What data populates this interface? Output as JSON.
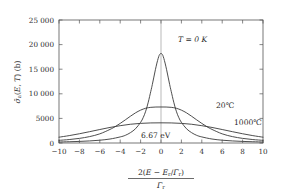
{
  "chart_data": {
    "type": "line",
    "title": "",
    "subtitle": "",
    "xlabel_numerator": "2(E − Eᵣ/Γᵣ)",
    "xlabel_denominator": "Γᵣ",
    "ylabel": "σ̄ₐ(E, T)  (b)",
    "xlim": [
      -10,
      10
    ],
    "ylim": [
      0,
      25000
    ],
    "xticks": [
      -10,
      -8,
      -6,
      -4,
      -2,
      0,
      2,
      4,
      6,
      8,
      10
    ],
    "xticklabels": [
      "−10",
      "−8",
      "−6",
      "−4",
      "−2",
      "0",
      "2",
      "4",
      "6",
      "8",
      "10"
    ],
    "yticks": [
      0,
      5000,
      10000,
      15000,
      20000,
      25000
    ],
    "yticklabels": [
      "0",
      "5000",
      "10 000",
      "15 000",
      "20 000",
      "25 000"
    ],
    "grid": false,
    "vertical_reference_line_x": 0,
    "legend_position": "inline-annotations",
    "series": [
      {
        "name": "T = 0 K",
        "peak_value": 21000,
        "half_width": 1.0,
        "color": "#3a3a3a",
        "x": [
          -10,
          -9,
          -8,
          -7,
          -6,
          -5,
          -4,
          -3.5,
          -3,
          -2.5,
          -2,
          -1.75,
          -1.5,
          -1.25,
          -1,
          -0.85,
          -0.7,
          -0.55,
          -0.4,
          -0.28,
          -0.18,
          -0.1,
          -0.05,
          0,
          0.05,
          0.1,
          0.18,
          0.28,
          0.4,
          0.55,
          0.7,
          0.85,
          1,
          1.25,
          1.5,
          1.75,
          2,
          2.5,
          3,
          3.5,
          4,
          5,
          6,
          7,
          8,
          9,
          10
        ],
        "y": [
          208,
          256,
          323,
          420,
          568,
          808,
          1235,
          1556,
          2100,
          2897,
          4200,
          5142,
          6462,
          8296,
          10500,
          11884,
          13399,
          14892,
          16246,
          17174,
          17804,
          18069,
          18173,
          18200,
          18173,
          18069,
          17804,
          17174,
          16246,
          14892,
          13399,
          11884,
          10500,
          8296,
          6462,
          5142,
          4200,
          2897,
          2100,
          1556,
          1235,
          808,
          568,
          420,
          323,
          256,
          208
        ]
      },
      {
        "name": "20℃",
        "peak_value": 7300,
        "half_width": 2.6,
        "color": "#3a3a3a",
        "x": [
          -10,
          -9,
          -8,
          -7,
          -6,
          -5,
          -4.5,
          -4,
          -3.5,
          -3,
          -2.5,
          -2,
          -1.5,
          -1,
          -0.5,
          0,
          0.5,
          1,
          1.5,
          2,
          2.5,
          3,
          3.5,
          4,
          4.5,
          5,
          6,
          7,
          8,
          9,
          10
        ],
        "y": [
          540,
          700,
          940,
          1300,
          1860,
          2760,
          3320,
          3980,
          4700,
          5440,
          6130,
          6680,
          7060,
          7250,
          7310,
          7320,
          7310,
          7250,
          7060,
          6680,
          6130,
          5440,
          4700,
          3980,
          3320,
          2760,
          1860,
          1300,
          940,
          700,
          540
        ]
      },
      {
        "name": "1000℃",
        "peak_value": 4100,
        "half_width": 5.2,
        "color": "#3a3a3a",
        "x": [
          -10,
          -9,
          -8,
          -7,
          -6,
          -5,
          -4,
          -3,
          -2,
          -1,
          0,
          1,
          2,
          3,
          4,
          5,
          6,
          7,
          8,
          9,
          10
        ],
        "y": [
          1180,
          1500,
          1880,
          2300,
          2740,
          3160,
          3520,
          3810,
          3990,
          4080,
          4100,
          4080,
          3990,
          3810,
          3520,
          3160,
          2740,
          2300,
          1880,
          1500,
          1180
        ]
      }
    ],
    "annotations": [
      {
        "name": "t0k",
        "text": "T = 0 K",
        "x": 1.6,
        "y": 19800,
        "style": "italic"
      },
      {
        "name": "t20c",
        "text": "20℃",
        "x": 5.4,
        "y": 7600,
        "style": "upright"
      },
      {
        "name": "t1000c",
        "text": "1000℃",
        "x": 7.8,
        "y": 4500,
        "style": "upright"
      },
      {
        "name": "energy",
        "text": "6.67 eV",
        "x": 0.55,
        "y": 1850,
        "style": "upright"
      }
    ]
  },
  "axis_titles": {
    "y": "σ̄ₐ(E, T)  (b)",
    "x_numerator": "2(E − Eᵣ/Γᵣ)",
    "x_denominator": "Γᵣ"
  },
  "ticks": {
    "y": [
      "25 000",
      "20 000",
      "15 000",
      "10 000",
      "5000",
      "0"
    ],
    "x": [
      "−10",
      "−8",
      "−6",
      "−4",
      "−2",
      "0",
      "2",
      "4",
      "6",
      "8",
      "10"
    ]
  },
  "annotations": {
    "curve_t0": "T = 0 K",
    "curve_20c": "20℃",
    "curve_1000c": "1000℃",
    "resonance_energy": "6.67 eV"
  },
  "colors": {
    "curve": "#3a3a3a",
    "axis": "#555555",
    "text": "#2b2b2b",
    "background": "#ffffff"
  }
}
